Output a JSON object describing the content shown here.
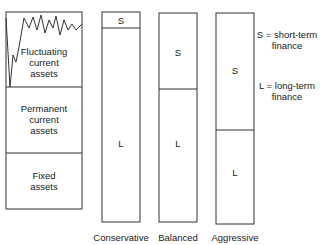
{
  "assets": {
    "fluctuating": [
      "Fluctuating",
      "current",
      "assets"
    ],
    "permanent": [
      "Permanent",
      "current",
      "assets"
    ],
    "fixed": [
      "Fixed",
      "assets"
    ]
  },
  "strategies": [
    {
      "name": "Conservative",
      "short_label": "S",
      "long_label": "L"
    },
    {
      "name": "Balanced",
      "short_label": "S",
      "long_label": "L"
    },
    {
      "name": "Aggressive",
      "short_label": "S",
      "long_label": "L"
    }
  ],
  "legend": {
    "short": [
      "S = short-term",
      "finance"
    ],
    "long": [
      "L = long-term",
      "finance"
    ]
  }
}
